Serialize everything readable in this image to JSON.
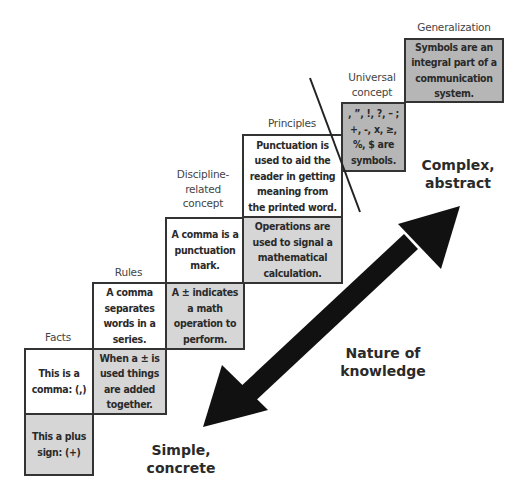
{
  "diagram": {
    "type": "staircase-with-arrow",
    "steps": [
      {
        "level": "Facts",
        "label": "Facts",
        "punctuation_text": "This is a\ncomma: (,)",
        "math_text": "This a plus\nsign:  (+)"
      },
      {
        "level": "Rules",
        "label": "Rules",
        "punctuation_text": "A comma\nseparates\nwords in a\nseries.",
        "math_text": "When a ± is\nused things\nare added\ntogether."
      },
      {
        "level": "Discipline-related concept",
        "label": "Discipline-\nrelated\nconcept",
        "punctuation_text": "A comma is a\npunctuation\nmark.",
        "math_text": "A ± indicates\na math\noperation to\nperform."
      },
      {
        "level": "Principles",
        "label": "Principles",
        "punctuation_text": "Punctuation is\nused to aid the\nreader in getting\nmeaning from\nthe printed word.",
        "math_text": "Operations are\nused to signal a\nmathematical\ncalculation."
      },
      {
        "level": "Universal concept",
        "label": "Universal\nconcept",
        "combined_text": ", ”, !, ?, – ;\n+, -, x, ≥,\n%, $ are\nsymbols."
      },
      {
        "level": "Generalization",
        "label": "Generalization",
        "combined_text": "Symbols are an\nintegral part of a\ncommunication\nsystem."
      }
    ],
    "arrow": {
      "label": "Nature of\nknowledge",
      "low_end_label": "Simple,\nconcrete",
      "high_end_label": "Complex,\nabstract"
    },
    "colors": {
      "white_box": "#ffffff",
      "light_gray_box": "#d6d6d6",
      "dark_gray_box": "#b6b6b6",
      "border": "#333333",
      "arrow": "#111111"
    }
  }
}
